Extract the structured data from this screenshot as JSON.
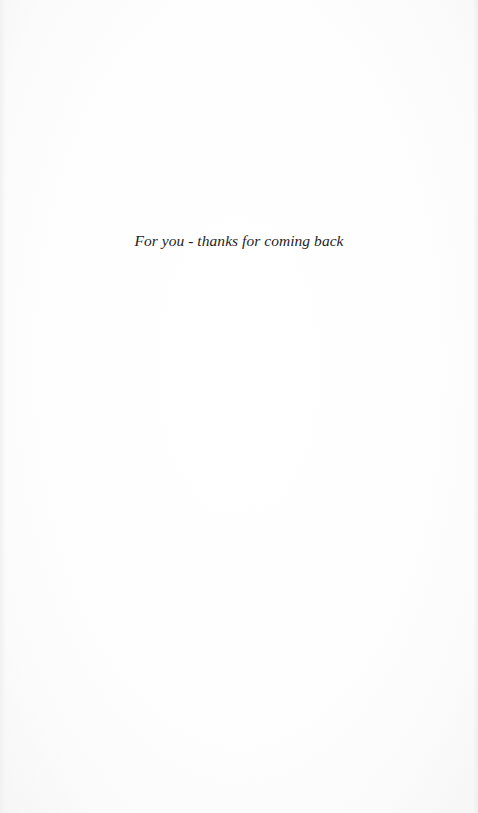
{
  "page": {
    "type": "dedication",
    "background_color": "#fdfdfd",
    "text_color": "#1e1e1e"
  },
  "dedication": {
    "text": "For you - thanks for coming back"
  }
}
